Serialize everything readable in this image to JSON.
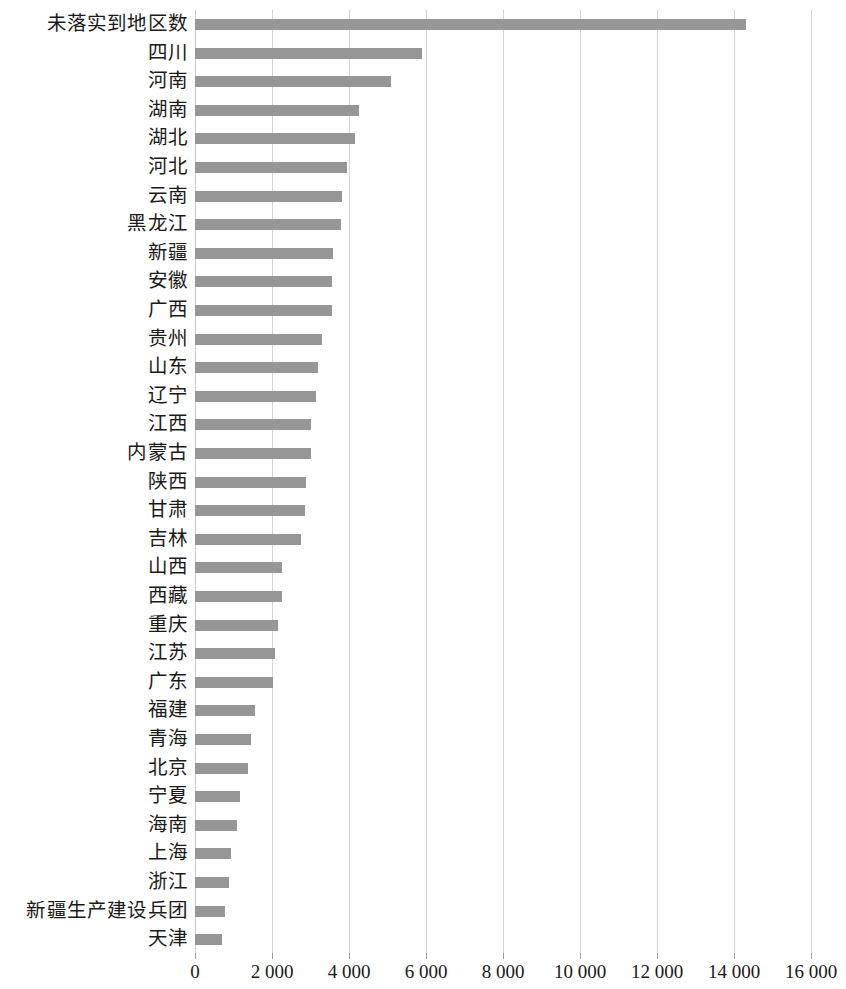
{
  "chart_data": {
    "type": "bar",
    "orientation": "horizontal",
    "title": "",
    "subtitle": "",
    "xlabel": "",
    "ylabel": "",
    "xlim": [
      0,
      16000
    ],
    "ylim": null,
    "grid": true,
    "legend": null,
    "legend_position": "none",
    "bar_color": "#969696",
    "gridline_color": "#d4d4d4",
    "thousands_separator": " ",
    "xticks": [
      0,
      2000,
      4000,
      6000,
      8000,
      10000,
      12000,
      14000,
      16000
    ],
    "xtick_labels": [
      "0",
      "2 000",
      "4 000",
      "6 000",
      "8 000",
      "10 000",
      "12 000",
      "14 000",
      "16 000"
    ],
    "categories": [
      "未落实到地区数",
      "四川",
      "河南",
      "湖南",
      "湖北",
      "河北",
      "云南",
      "黑龙江",
      "新疆",
      "安徽",
      "广西",
      "贵州",
      "山东",
      "辽宁",
      "江西",
      "内蒙古",
      "陕西",
      "甘肃",
      "吉林",
      "山西",
      "西藏",
      "重庆",
      "江苏",
      "广东",
      "福建",
      "青海",
      "北京",
      "宁夏",
      "海南",
      "上海",
      "浙江",
      "新疆生产建设兵团",
      "天津"
    ],
    "values": [
      14300,
      5900,
      5100,
      4265,
      4160,
      3950,
      3820,
      3800,
      3590,
      3560,
      3555,
      3300,
      3200,
      3150,
      3020,
      3010,
      2890,
      2860,
      2760,
      2270,
      2265,
      2150,
      2080,
      2020,
      1560,
      1460,
      1370,
      1170,
      1090,
      935,
      890,
      780,
      700
    ]
  }
}
